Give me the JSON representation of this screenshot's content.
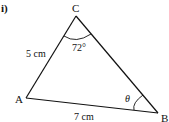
{
  "part_label": "i)",
  "diagram": {
    "type": "triangle",
    "vertices": {
      "A": {
        "label": "A"
      },
      "B": {
        "label": "B"
      },
      "C": {
        "label": "C"
      }
    },
    "sides": {
      "AC": {
        "label": "5 cm",
        "length": 5,
        "unit": "cm"
      },
      "AB": {
        "label": "7 cm",
        "length": 7,
        "unit": "cm"
      }
    },
    "angles": {
      "C": {
        "label": "72°",
        "value_deg": 72
      },
      "B": {
        "label": "θ",
        "unknown": true
      }
    }
  },
  "colors": {
    "stroke": "#111111",
    "background": "#ffffff"
  }
}
